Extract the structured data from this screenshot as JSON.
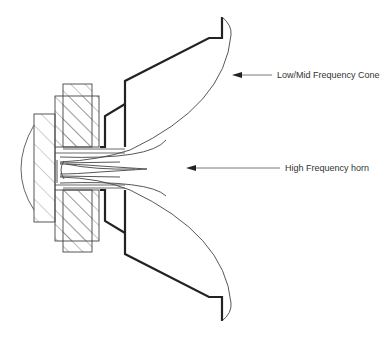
{
  "diagram": {
    "labels": {
      "cone": "Low/Mid Frequency Cone",
      "horn": "High Frequency horn"
    },
    "colors": {
      "line": "#222222",
      "thin_line": "#555555",
      "hatch": "#666666",
      "text": "#333333",
      "background": "#ffffff"
    }
  }
}
